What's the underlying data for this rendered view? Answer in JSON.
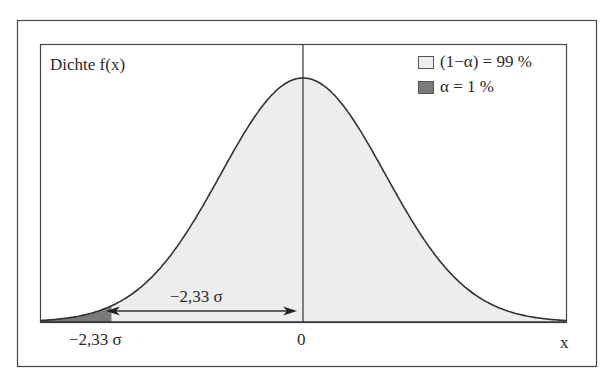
{
  "chart_data": {
    "type": "area",
    "title": "",
    "ylabel": "Dichte f(x)",
    "xlabel": "x",
    "distribution": "standard normal density",
    "x_range": [
      -3.2,
      3.2
    ],
    "x_ticks": [
      {
        "value": -2.33,
        "label": "−2,33 σ"
      },
      {
        "value": 0,
        "label": "0"
      }
    ],
    "shaded_regions": [
      {
        "name": "(1−α) = 99 %",
        "from": -2.33,
        "to": 3.2,
        "color": "#ededed"
      },
      {
        "name": "α = 1 %",
        "from": -3.2,
        "to": -2.33,
        "color": "#7a7a7a"
      }
    ],
    "annotations": [
      {
        "type": "double-arrow",
        "from": -2.33,
        "to": 0,
        "label": "−2,33 σ"
      },
      {
        "type": "vertical-line",
        "x": 0
      }
    ],
    "legend": [
      {
        "label": "(1−α) = 99 %",
        "color": "#ededed"
      },
      {
        "label": "α = 1 %",
        "color": "#7a7a7a"
      }
    ],
    "legend_position": "top-right",
    "grid": false
  },
  "labels": {
    "y_axis": "Dichte f(x)",
    "x_axis": "x",
    "tick_left": "−2,33 σ",
    "tick_zero": "0",
    "arrow_label": "−2,33 σ",
    "legend_1": "(1−α) = 99 %",
    "legend_2": "α = 1 %"
  },
  "colors": {
    "fill_main": "#ededed",
    "fill_tail": "#7a7a7a",
    "line": "#333333"
  }
}
